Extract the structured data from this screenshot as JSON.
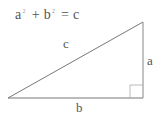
{
  "formula": {
    "a": "a",
    "a_exp": "2",
    "plus": " + ",
    "b": "b",
    "b_exp": "2",
    "equals": " = ",
    "c": "c"
  },
  "labels": {
    "hypotenuse": "c",
    "vertical_side": "a",
    "base_side": "b"
  },
  "colors": {
    "stroke": "#777777",
    "text": "#555555"
  }
}
